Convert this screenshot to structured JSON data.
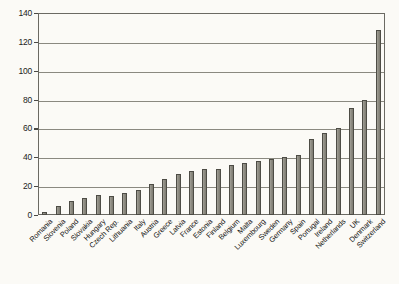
{
  "chart_data": {
    "type": "bar",
    "title": "",
    "subtitle": "",
    "xlabel": "",
    "ylabel": "",
    "ylim": [
      0,
      140
    ],
    "yticks": [
      0,
      20,
      40,
      60,
      80,
      100,
      120,
      140
    ],
    "ytick_labels": [
      "0",
      "20",
      "40",
      "60",
      "80",
      "100",
      "120",
      "140"
    ],
    "grid": true,
    "legend": false,
    "orientation": "vertical",
    "categories": [
      "Romania",
      "Slovenia",
      "Poland",
      "Slovakia",
      "Hungary",
      "Czech Rep.",
      "Lithuania",
      "Italy",
      "Austria",
      "Greece",
      "Latvia",
      "France",
      "Estonia",
      "Finland",
      "Belgium",
      "Malta",
      "Luxembourg",
      "Sweden",
      "Germany",
      "Spain",
      "Portugal",
      "Ireland",
      "Netherlands",
      "UK",
      "Denmark",
      "Switzerland"
    ],
    "values": [
      2,
      6,
      10,
      12,
      14,
      13.5,
      15,
      17.5,
      21.5,
      25,
      28.5,
      30.5,
      32,
      32,
      34.5,
      36,
      37.5,
      38.5,
      40,
      41.5,
      53,
      57,
      60,
      74,
      80,
      128
    ],
    "bar_color": "#8d8b80",
    "bar_edge_color": "#4d4c45",
    "grid_color": "#8a8980",
    "axis_color": "#6b6a63",
    "background_color": "#fbfaf6"
  }
}
